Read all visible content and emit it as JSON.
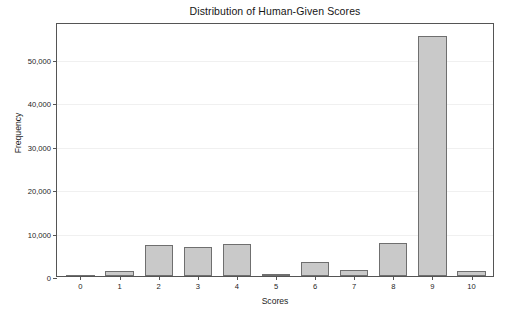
{
  "chart_data": {
    "type": "bar",
    "title": "Distribution of Human-Given Scores",
    "xlabel": "Scores",
    "ylabel": "Frequency",
    "categories": [
      "0",
      "1",
      "2",
      "3",
      "4",
      "5",
      "6",
      "7",
      "8",
      "9",
      "10"
    ],
    "values": [
      60,
      1100,
      7050,
      6700,
      7350,
      300,
      3300,
      1350,
      7500,
      55300,
      1050
    ],
    "ylim": [
      0,
      58500
    ],
    "xlim": [
      -0.6,
      10.6
    ],
    "yticks": [
      0,
      10000,
      20000,
      30000,
      40000,
      50000
    ],
    "ytick_labels": [
      "0",
      "10,000",
      "20,000",
      "30,000",
      "40,000",
      "50,000"
    ],
    "grid": "horizontal",
    "legend": "none",
    "bar_color": "#c9c9c9",
    "bar_edge_color": "#6f6f6f",
    "axis_color": "#555555",
    "grid_color": "#f0f0f0",
    "background_color": "#ffffff"
  }
}
